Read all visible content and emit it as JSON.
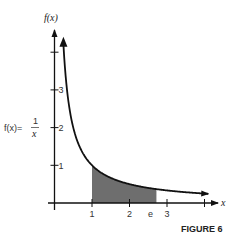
{
  "chart_data": {
    "type": "area",
    "title": "FIGURE 6",
    "function_label": "f(x) = 1/x",
    "function_numerator": "1",
    "function_denominator": "x",
    "function_lhs": "f(x)=",
    "xlabel": "x",
    "ylabel": "f(x)",
    "x_ticks": [
      {
        "value": 1,
        "label": "1"
      },
      {
        "value": 2,
        "label": "2"
      },
      {
        "value": 3,
        "label": "3"
      },
      {
        "value": 4,
        "label": ""
      }
    ],
    "y_ticks": [
      {
        "value": 1,
        "label": "1"
      },
      {
        "value": 2,
        "label": "2"
      },
      {
        "value": 3,
        "label": "3"
      },
      {
        "value": 4,
        "label": ""
      }
    ],
    "annotations": [
      {
        "x": 2.718,
        "label": "e"
      }
    ],
    "shaded_region": {
      "from": 1,
      "to": 2.718,
      "description": "area under 1/x from 1 to e"
    },
    "xlim": [
      0,
      4.3
    ],
    "ylim": [
      0,
      4.5
    ],
    "series": [
      {
        "name": "f(x)=1/x",
        "x": [
          0.22,
          0.3,
          0.4,
          0.5,
          0.75,
          1,
          1.5,
          2,
          2.718,
          3,
          3.5,
          4
        ],
        "values": [
          4.5,
          3.33,
          2.5,
          2,
          1.33,
          1,
          0.67,
          0.5,
          0.37,
          0.33,
          0.29,
          0.25
        ]
      }
    ],
    "grid": false,
    "legend": "none"
  }
}
